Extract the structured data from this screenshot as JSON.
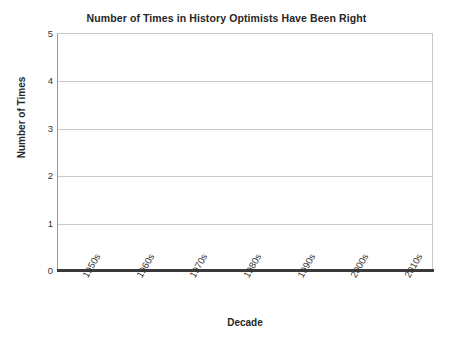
{
  "chart_data": {
    "type": "bar",
    "title": "Number of Times in History Optimists Have Been Right",
    "xlabel": "Decade",
    "ylabel": "Number of Times",
    "categories": [
      "1950s",
      "1960s",
      "1970s",
      "1980s",
      "1990s",
      "2000s",
      "2010s"
    ],
    "values": [
      0,
      0,
      0,
      0,
      0,
      0,
      0
    ],
    "ylim": [
      0,
      5
    ],
    "yticks": [
      0,
      1,
      2,
      3,
      4,
      5
    ],
    "ytick_labels": [
      "0",
      "1",
      "2",
      "3",
      "4",
      "5"
    ],
    "grid": true,
    "grid_axis": "y",
    "legend": false,
    "legend_position": "none",
    "series": [
      {
        "name": "Number of Times",
        "values": [
          0,
          0,
          0,
          0,
          0,
          0,
          0
        ]
      }
    ],
    "annotations": [],
    "colors": {
      "background": "#ffffff",
      "gridline": "#c9c9c9",
      "axis_line": "#9a9a9a",
      "baseline": "#3a3a3a",
      "bar": "#4472a8",
      "text": "#262626"
    }
  }
}
